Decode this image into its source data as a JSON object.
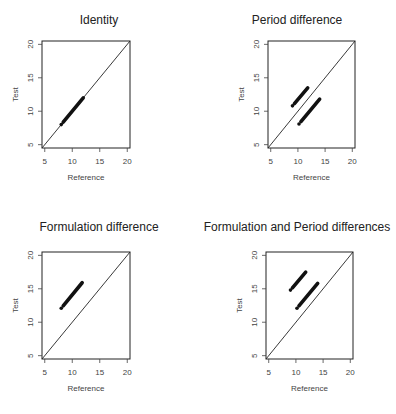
{
  "chart_data": [
    {
      "type": "scatter",
      "title": "Identity",
      "xlabel": "Reference",
      "ylabel": "Test",
      "xlim": [
        4.5,
        20.5
      ],
      "ylim": [
        4.5,
        20.5
      ],
      "xticks": [
        5,
        10,
        15,
        20
      ],
      "yticks": [
        5,
        10,
        15,
        20
      ],
      "reference_line": "y = x",
      "series": [
        {
          "name": "points",
          "x_from": 8,
          "x_to": 12,
          "y_from": 8,
          "y_to": 12
        }
      ]
    },
    {
      "type": "scatter",
      "title": "Period difference",
      "xlabel": "Reference",
      "ylabel": "Test",
      "xlim": [
        4.5,
        20.5
      ],
      "ylim": [
        4.5,
        20.5
      ],
      "xticks": [
        5,
        10,
        15,
        20
      ],
      "yticks": [
        5,
        10,
        15,
        20
      ],
      "reference_line": "y = x",
      "series": [
        {
          "name": "upper band",
          "x_from": 9,
          "x_to": 11.8,
          "y_from": 10.8,
          "y_to": 13.5
        },
        {
          "name": "lower band",
          "x_from": 10.2,
          "x_to": 14,
          "y_from": 8.1,
          "y_to": 11.8
        }
      ]
    },
    {
      "type": "scatter",
      "title": "Formulation difference",
      "xlabel": "Reference",
      "ylabel": "Test",
      "xlim": [
        4.5,
        20.5
      ],
      "ylim": [
        4.5,
        20.5
      ],
      "xticks": [
        5,
        10,
        15,
        20
      ],
      "yticks": [
        5,
        10,
        15,
        20
      ],
      "reference_line": "y = x",
      "series": [
        {
          "name": "points",
          "x_from": 8,
          "x_to": 11.8,
          "y_from": 12.1,
          "y_to": 15.9
        }
      ]
    },
    {
      "type": "scatter",
      "title": "Formulation and Period differences",
      "xlabel": "Reference",
      "ylabel": "Test",
      "xlim": [
        4.5,
        20.5
      ],
      "ylim": [
        4.5,
        20.5
      ],
      "xticks": [
        5,
        10,
        15,
        20
      ],
      "yticks": [
        5,
        10,
        15,
        20
      ],
      "reference_line": "y = x",
      "series": [
        {
          "name": "upper band",
          "x_from": 9,
          "x_to": 11.8,
          "y_from": 14.8,
          "y_to": 17.5
        },
        {
          "name": "lower band",
          "x_from": 10.2,
          "x_to": 14,
          "y_from": 12.1,
          "y_to": 15.8
        }
      ]
    }
  ],
  "layout": {
    "panels": [
      {
        "left": 0,
        "top": 0,
        "box": [
          42,
          41,
          130,
          148
        ]
      },
      {
        "left": 198,
        "top": 0,
        "box": [
          268,
          41,
          355,
          148
        ]
      },
      {
        "left": 0,
        "top": 207,
        "box": [
          42,
          252,
          130,
          359
        ]
      },
      {
        "left": 198,
        "top": 207,
        "box": [
          266,
          252,
          353,
          359
        ]
      }
    ]
  }
}
